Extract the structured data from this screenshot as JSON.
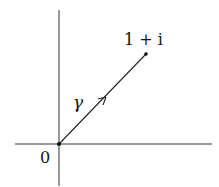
{
  "diagram": {
    "type": "complex-plane-path",
    "labels": {
      "origin": "0",
      "endpoint": "1 + i",
      "path": "γ"
    },
    "origin_px": [
      59,
      144
    ],
    "endpoint_px": [
      146,
      54
    ],
    "colors": {
      "line": "#222222",
      "background": "#ffffff"
    }
  }
}
